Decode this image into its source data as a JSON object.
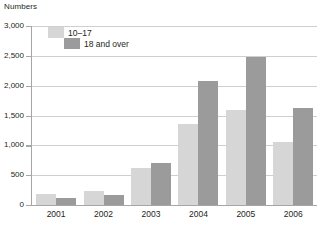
{
  "chart_data": {
    "type": "bar",
    "title": "",
    "ylabel": "Numbers",
    "xlabel": "",
    "categories": [
      "2001",
      "2002",
      "2003",
      "2004",
      "2005",
      "2006"
    ],
    "series": [
      {
        "name": "10–17",
        "color": "#d6d6d6",
        "values": [
          180,
          240,
          620,
          1350,
          1600,
          1050
        ]
      },
      {
        "name": "18 and over",
        "color": "#9b9b9b",
        "values": [
          120,
          170,
          710,
          2080,
          2480,
          1620
        ]
      }
    ],
    "ylim": [
      0,
      3000
    ],
    "yticks": [
      0,
      500,
      1000,
      1500,
      2000,
      2500,
      3000
    ],
    "ytick_labels": [
      "0",
      "500",
      "1,000",
      "1,500",
      "2,000",
      "2,500",
      "3,000"
    ],
    "grid": true,
    "legend_position": "top-left"
  },
  "legend": {
    "items": [
      {
        "label": "10–17",
        "color": "#d6d6d6"
      },
      {
        "label": "18 and over",
        "color": "#9b9b9b"
      }
    ]
  },
  "colors": {
    "youth": "#d6d6d6",
    "adult": "#9b9b9b",
    "grid": "#cfcfcf",
    "axis": "#a6a6a6",
    "text": "#231f20"
  }
}
